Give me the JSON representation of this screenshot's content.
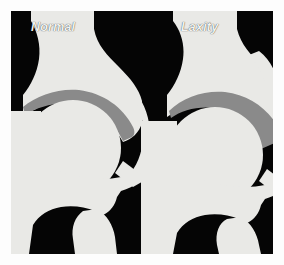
{
  "figure": {
    "title_left": "Normal",
    "title_right": "Laxity",
    "border_color": "#fdfdfd",
    "panel_background": "#050505",
    "bone_color": "#e9e9e6",
    "cartilage_color": "#8a8a8a",
    "label_color": "#f2f2f0"
  },
  "panels": [
    {
      "name": "normal-hip",
      "label": "Normal",
      "joint_space": "thin uniform crescent",
      "structures": [
        "ilium",
        "acetabulum",
        "femoral-head",
        "femoral-neck",
        "greater-trochanter",
        "femoral-shaft",
        "lesser-trochanter"
      ]
    },
    {
      "name": "laxity-hip",
      "label": "Laxity",
      "joint_space": "widened lateral wedge",
      "structures": [
        "ilium",
        "acetabulum",
        "femoral-head",
        "femoral-neck",
        "greater-trochanter",
        "femoral-shaft",
        "lesser-trochanter"
      ]
    }
  ]
}
